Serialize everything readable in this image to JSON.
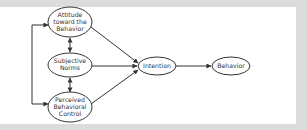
{
  "diagram": {
    "title": "",
    "type": "theory-of-planned-behavior",
    "nodes": [
      {
        "id": "attitude",
        "lines": [
          "Attitude",
          "toward the",
          "Behavior"
        ]
      },
      {
        "id": "norms",
        "lines": [
          "Subjective",
          "Norms"
        ]
      },
      {
        "id": "control",
        "lines": [
          "Perceived",
          "Behavioral",
          "Control"
        ]
      },
      {
        "id": "intention",
        "lines": [
          "Intention"
        ]
      },
      {
        "id": "behavior",
        "lines": [
          "Behavior"
        ]
      }
    ],
    "edges": [
      {
        "from": "attitude",
        "to": "intention"
      },
      {
        "from": "norms",
        "to": "intention"
      },
      {
        "from": "control",
        "to": "intention"
      },
      {
        "from": "intention",
        "to": "behavior"
      },
      {
        "from": "attitude",
        "to": "norms",
        "bidirectional": true
      },
      {
        "from": "norms",
        "to": "control",
        "bidirectional": true
      },
      {
        "from": "attitude",
        "to": "control",
        "bidirectional": true,
        "style": "left-bracket"
      }
    ],
    "colors": {
      "stroke": "#333333",
      "background": "#ffffff",
      "frame": "#dcdcdc"
    }
  }
}
